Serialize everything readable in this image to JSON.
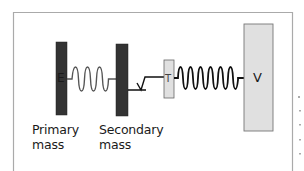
{
  "diagram": {
    "type": "mass-spring model",
    "components": {
      "primary_mass": {
        "inner_label": "E",
        "caption_line1": "Primary",
        "caption_line2": "mass",
        "color": "#333333"
      },
      "spring_1": {
        "color": "#555555"
      },
      "secondary_mass": {
        "caption_line1": "Secondary",
        "caption_line2": "mass",
        "color": "#333333"
      },
      "damper": {
        "label": "V"
      },
      "t_block": {
        "label": "T",
        "color": "#e0e0e0"
      },
      "spring_2": {
        "color": "#111111"
      },
      "v_block": {
        "label": "V",
        "color": "#e0e0e0"
      }
    },
    "frame_color": "#aaaaaa"
  }
}
